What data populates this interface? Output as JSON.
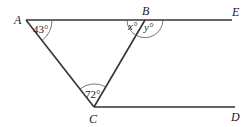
{
  "diagram": {
    "points": {
      "A": {
        "label": "A",
        "x": 26,
        "y": 20
      },
      "B": {
        "label": "B",
        "x": 145,
        "y": 20
      },
      "E": {
        "label": "E",
        "x": 232,
        "y": 20
      },
      "C": {
        "label": "C",
        "x": 94,
        "y": 107
      },
      "D": {
        "label": "D",
        "x": 235,
        "y": 107
      }
    },
    "segments": [
      "A-E",
      "A-C",
      "C-B",
      "C-D"
    ],
    "angles": {
      "A": {
        "text": "43°",
        "value": 43
      },
      "C": {
        "text": "72°",
        "value": 72
      },
      "B_left": {
        "text": "x°",
        "variable": "x"
      },
      "B_right": {
        "text": "y°",
        "variable": "y"
      }
    }
  }
}
